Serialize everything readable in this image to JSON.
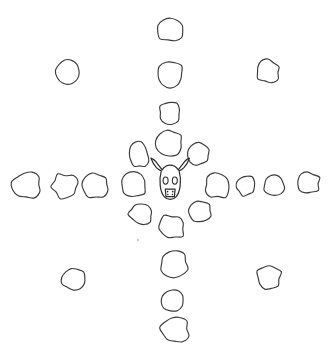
{
  "figure": {
    "background_color": "#ffffff",
    "stone_stroke_color": "#3a3a3a",
    "skull_stroke_color": "#2b2b2b",
    "stone_fill_color": "#ffffff",
    "canvas": {
      "width": 333,
      "height": 355
    }
  },
  "center_emblem": {
    "name": "bison-skull",
    "label": "Bison skull",
    "cx": 170,
    "cy": 182,
    "features": [
      "left-horn",
      "right-horn",
      "left-eye-socket",
      "right-eye-socket",
      "muzzle",
      "nostril-marks"
    ]
  },
  "groups": [
    {
      "id": "north-arm",
      "label": "North arm",
      "count": 4,
      "stones": [
        {
          "id": "n4",
          "cx": 171,
          "cy": 30,
          "rx": 14,
          "ry": 12,
          "rot": 6,
          "seed": 11
        },
        {
          "id": "n3",
          "cx": 170,
          "cy": 75,
          "rx": 14,
          "ry": 13,
          "rot": -8,
          "seed": 23
        },
        {
          "id": "n2",
          "cx": 170,
          "cy": 112,
          "rx": 11,
          "ry": 11,
          "rot": 14,
          "seed": 37
        },
        {
          "id": "n1",
          "cx": 170,
          "cy": 143,
          "rx": 13,
          "ry": 12,
          "rot": -5,
          "seed": 41
        }
      ]
    },
    {
      "id": "south-arm",
      "label": "South arm",
      "count": 4,
      "stones": [
        {
          "id": "s1",
          "cx": 172,
          "cy": 227,
          "rx": 13,
          "ry": 12,
          "rot": 10,
          "seed": 53
        },
        {
          "id": "s2",
          "cx": 174,
          "cy": 264,
          "rx": 14,
          "ry": 13,
          "rot": -12,
          "seed": 67
        },
        {
          "id": "s3",
          "cx": 173,
          "cy": 300,
          "rx": 12,
          "ry": 11,
          "rot": 4,
          "seed": 71
        },
        {
          "id": "s4",
          "cx": 175,
          "cy": 330,
          "rx": 14,
          "ry": 13,
          "rot": -6,
          "seed": 83
        }
      ]
    },
    {
      "id": "west-arm",
      "label": "West arm",
      "count": 4,
      "stones": [
        {
          "id": "w1",
          "cx": 134,
          "cy": 185,
          "rx": 13,
          "ry": 12,
          "rot": 7,
          "seed": 97
        },
        {
          "id": "w2",
          "cx": 96,
          "cy": 186,
          "rx": 13,
          "ry": 12,
          "rot": -9,
          "seed": 103
        },
        {
          "id": "w3",
          "cx": 65,
          "cy": 186,
          "rx": 13,
          "ry": 12,
          "rot": 12,
          "seed": 109
        },
        {
          "id": "w4",
          "cx": 27,
          "cy": 185,
          "rx": 14,
          "ry": 13,
          "rot": -4,
          "seed": 127
        }
      ]
    },
    {
      "id": "east-arm",
      "label": "East arm",
      "count": 4,
      "stones": [
        {
          "id": "e1",
          "cx": 218,
          "cy": 186,
          "rx": 13,
          "ry": 12,
          "rot": -7,
          "seed": 131
        },
        {
          "id": "e2",
          "cx": 246,
          "cy": 186,
          "rx": 10,
          "ry": 10,
          "rot": 9,
          "seed": 139
        },
        {
          "id": "e3",
          "cx": 274,
          "cy": 185,
          "rx": 11,
          "ry": 11,
          "rot": -13,
          "seed": 149
        },
        {
          "id": "e4",
          "cx": 308,
          "cy": 183,
          "rx": 12,
          "ry": 11,
          "rot": 5,
          "seed": 151
        }
      ]
    },
    {
      "id": "inner-diagonals",
      "label": "Inner diagonal stones",
      "count": 4,
      "stones": [
        {
          "id": "d-nw",
          "cx": 139,
          "cy": 155,
          "rx": 10,
          "ry": 13,
          "rot": -10,
          "seed": 157
        },
        {
          "id": "d-ne",
          "cx": 199,
          "cy": 154,
          "rx": 11,
          "ry": 11,
          "rot": 8,
          "seed": 163
        },
        {
          "id": "d-sw",
          "cx": 141,
          "cy": 214,
          "rx": 12,
          "ry": 10,
          "rot": 13,
          "seed": 173
        },
        {
          "id": "d-se",
          "cx": 200,
          "cy": 212,
          "rx": 12,
          "ry": 11,
          "rot": -9,
          "seed": 179
        }
      ]
    },
    {
      "id": "outer-corners",
      "label": "Outer corner stones",
      "count": 4,
      "stones": [
        {
          "id": "c-nw",
          "cx": 69,
          "cy": 72,
          "rx": 12,
          "ry": 12,
          "rot": -11,
          "seed": 191
        },
        {
          "id": "c-ne",
          "cx": 268,
          "cy": 71,
          "rx": 12,
          "ry": 11,
          "rot": 9,
          "seed": 197
        },
        {
          "id": "c-sw",
          "cx": 74,
          "cy": 279,
          "rx": 13,
          "ry": 12,
          "rot": -6,
          "seed": 199
        },
        {
          "id": "c-se",
          "cx": 269,
          "cy": 277,
          "rx": 12,
          "ry": 12,
          "rot": 11,
          "seed": 211
        }
      ]
    }
  ],
  "speck": {
    "cx": 138,
    "cy": 240,
    "r": 1.2
  },
  "totals": {
    "stone_count": 24,
    "emblem_count": 1
  }
}
